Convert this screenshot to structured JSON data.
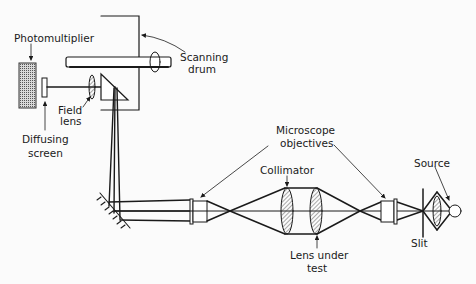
{
  "diagram": {
    "type": "optical-schematic",
    "colors": {
      "ink": "#1a1a1a",
      "background": "#fbfbfb",
      "hatch": "#555555"
    },
    "labels": {
      "photomultiplier": "Photomultiplier",
      "scanning_drum_line1": "Scanning",
      "scanning_drum_line2": "drum",
      "field_lens_line1": "Field",
      "field_lens_line2": "lens",
      "diffusing_screen_line1": "Diffusing",
      "diffusing_screen_line2": "screen",
      "microscope_objectives_line1": "Microscope",
      "microscope_objectives_line2": "objectives",
      "collimator": "Collimator",
      "lens_under_test_line1": "Lens under",
      "lens_under_test_line2": "test",
      "source": "Source",
      "slit": "Slit"
    },
    "components": [
      "photomultiplier",
      "diffusing-screen",
      "field-lens",
      "prism",
      "scanning-drum",
      "plane-mirror",
      "microscope-objective-left",
      "lens-under-test",
      "collimator",
      "microscope-objective-right",
      "slit",
      "condenser-lens",
      "source-lamp"
    ]
  }
}
